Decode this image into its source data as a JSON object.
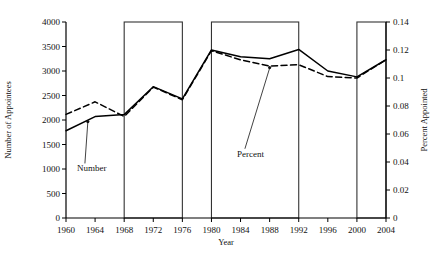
{
  "chart_data": {
    "type": "line",
    "title": "",
    "xlabel": "Year",
    "ylabel": "Number of Appointees",
    "y2label": "Percent Appointed",
    "xlim": [
      1960,
      2004
    ],
    "ylim": [
      0,
      4000
    ],
    "y2lim": [
      0,
      0.14
    ],
    "grid": false,
    "legend": "annotations",
    "x_ticks": [
      "1960",
      "1964",
      "1968",
      "1972",
      "1976",
      "1980",
      "1984",
      "1988",
      "1992",
      "1996",
      "2000",
      "2004"
    ],
    "x_tick_values": [
      1960,
      1964,
      1968,
      1972,
      1976,
      1980,
      1984,
      1988,
      1992,
      1996,
      2000,
      2004
    ],
    "y_ticks": [
      "0",
      "500",
      "1000",
      "1500",
      "2000",
      "2500",
      "3000",
      "3500",
      "4000"
    ],
    "y_tick_values": [
      0,
      500,
      1000,
      1500,
      2000,
      2500,
      3000,
      3500,
      4000
    ],
    "y2_ticks": [
      "0",
      "0.02",
      "0.04",
      "0.06",
      "0.08",
      "0.1",
      "0.12",
      "0.14"
    ],
    "y2_tick_values": [
      0,
      0.02,
      0.04,
      0.06,
      0.08,
      0.1,
      0.12,
      0.14
    ],
    "x": [
      1960,
      1964,
      1968,
      1972,
      1976,
      1980,
      1984,
      1988,
      1992,
      1996,
      2000,
      2004
    ],
    "series": [
      {
        "name": "Number",
        "style": "solid",
        "axis": "left",
        "values": [
          1780,
          2070,
          2110,
          2680,
          2430,
          3430,
          3290,
          3250,
          3440,
          3000,
          2880,
          3230
        ]
      },
      {
        "name": "Percent",
        "style": "dashed",
        "axis": "right",
        "values": [
          0.074,
          0.083,
          0.0725,
          0.0935,
          0.0845,
          0.1195,
          0.113,
          0.1085,
          0.1095,
          0.101,
          0.1,
          0.113
        ]
      }
    ],
    "annotations": [
      {
        "text": "Number",
        "points_to_series": "Number",
        "x": 1963,
        "label_x": 1961.5,
        "label_y_value": 950
      },
      {
        "text": "Percent",
        "points_to_series": "Percent",
        "x": 1988,
        "label_x": 1983.5,
        "label_y_value": 1250
      }
    ],
    "shaded_periods": [
      {
        "start": 1968,
        "end": 1976,
        "top_value": 4000
      },
      {
        "start": 1980,
        "end": 1992,
        "top_value": 4000
      },
      {
        "start": 2000,
        "end": 2004,
        "top_value": 4000
      }
    ],
    "colors": {
      "line": "#000000",
      "axis": "#000000",
      "box": "#333333",
      "background": "#ffffff"
    }
  }
}
